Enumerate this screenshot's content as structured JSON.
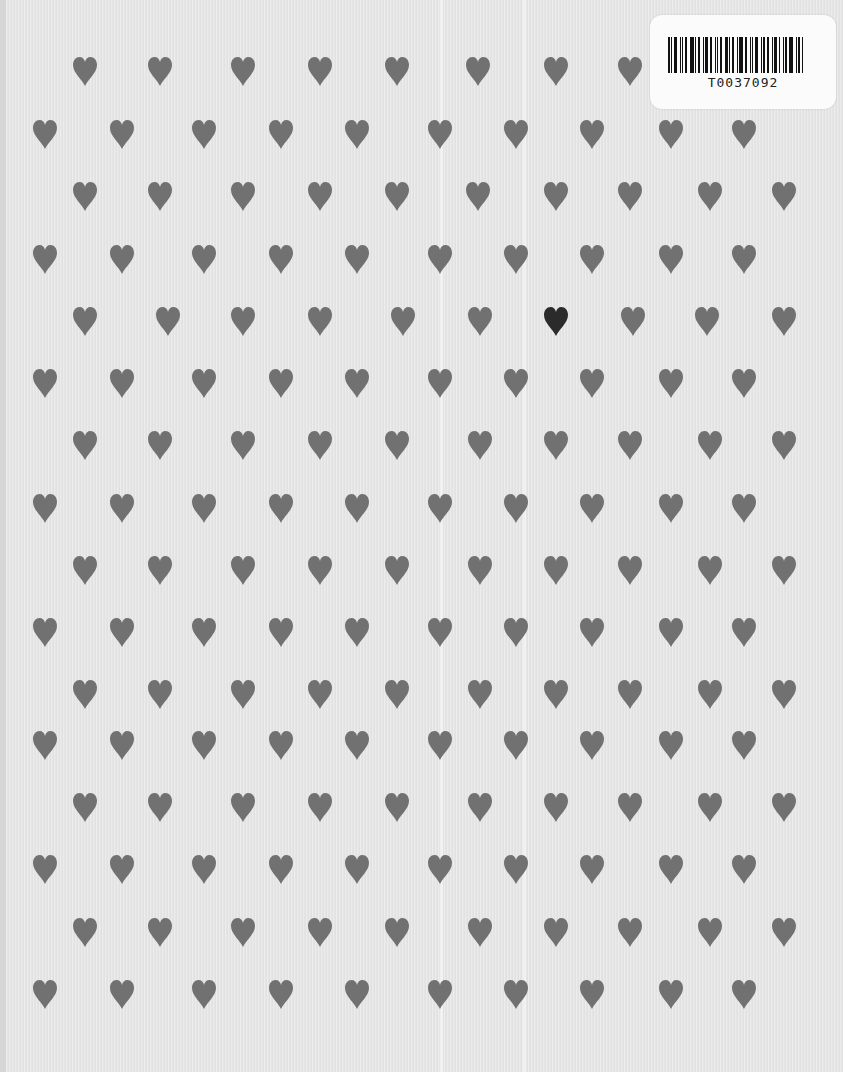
{
  "image": {
    "description": "Light gray ribbed fabric with repeating pattern of gray hearts, one black heart, and a barcode sticker",
    "background_color": "#e6e6e6",
    "heart_color": "#717171",
    "accent_heart_color": "#2b2b2b"
  },
  "label": {
    "code": "T0037092"
  },
  "pattern": {
    "rows": [
      {
        "y": 72,
        "xs": [
          85,
          160,
          243,
          320,
          397,
          478,
          556,
          630
        ]
      },
      {
        "y": 135,
        "xs": [
          45,
          122,
          204,
          281,
          357,
          440,
          516,
          592,
          671,
          744
        ]
      },
      {
        "y": 197,
        "xs": [
          85,
          160,
          243,
          320,
          397,
          478,
          556,
          630,
          710,
          784
        ]
      },
      {
        "y": 260,
        "xs": [
          45,
          122,
          204,
          281,
          357,
          440,
          516,
          592,
          671,
          744
        ]
      },
      {
        "y": 322,
        "xs": [
          85,
          168,
          243,
          320,
          403,
          480,
          556,
          633,
          707,
          784
        ]
      },
      {
        "y": 384,
        "xs": [
          45,
          122,
          204,
          281,
          357,
          440,
          516,
          592,
          671,
          744
        ]
      },
      {
        "y": 446,
        "xs": [
          85,
          160,
          243,
          320,
          397,
          480,
          556,
          630,
          710,
          784
        ]
      },
      {
        "y": 509,
        "xs": [
          45,
          122,
          204,
          281,
          357,
          440,
          516,
          592,
          671,
          744
        ]
      },
      {
        "y": 571,
        "xs": [
          85,
          160,
          243,
          320,
          397,
          480,
          556,
          630,
          710,
          784
        ]
      },
      {
        "y": 633,
        "xs": [
          45,
          122,
          204,
          281,
          357,
          440,
          516,
          592,
          671,
          744
        ]
      },
      {
        "y": 695,
        "xs": [
          85,
          160,
          243,
          320,
          397,
          480,
          556,
          630,
          710,
          784
        ]
      },
      {
        "y": 746,
        "xs": [
          45,
          122,
          204,
          281,
          357,
          440,
          516,
          592,
          671,
          744
        ]
      },
      {
        "y": 808,
        "xs": [
          85,
          160,
          243,
          320,
          397,
          480,
          556,
          630,
          710,
          784
        ]
      },
      {
        "y": 870,
        "xs": [
          45,
          122,
          204,
          281,
          357,
          440,
          516,
          592,
          671,
          744
        ]
      },
      {
        "y": 933,
        "xs": [
          85,
          160,
          243,
          320,
          397,
          480,
          556,
          630,
          710,
          784
        ]
      },
      {
        "y": 995,
        "xs": [
          45,
          122,
          204,
          281,
          357,
          440,
          516,
          592,
          671,
          744
        ]
      }
    ],
    "accent": {
      "x": 553,
      "y": 322
    }
  }
}
